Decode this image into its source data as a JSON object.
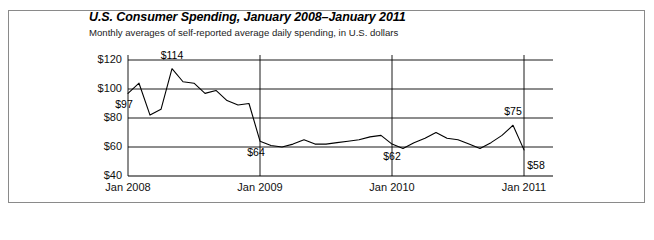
{
  "figure": {
    "title": "U.S. Consumer Spending, January 2008–January 2011",
    "subtitle": "Monthly averages of self-reported average daily spending, in U.S. dollars",
    "border_color": "#8a8a8a",
    "line_color": "#000000",
    "grid_color": "#000000",
    "background": "#ffffff"
  },
  "chart_data": {
    "type": "line",
    "title": "U.S. Consumer Spending, January 2008–January 2011",
    "subtitle": "Monthly averages of self-reported average daily spending, in U.S. dollars",
    "xlabel": "",
    "ylabel": "",
    "ylim": [
      40,
      120
    ],
    "xlim": [
      "Jan 2008",
      "Jan 2011"
    ],
    "ytick_labels": [
      "$120",
      "$100",
      "$80",
      "$60",
      "$40"
    ],
    "ytick_values": [
      120,
      100,
      80,
      60,
      40
    ],
    "xtick_labels": [
      "Jan 2008",
      "Jan 2009",
      "Jan 2010",
      "Jan 2011"
    ],
    "xtick_values": [
      "2008-01",
      "2009-01",
      "2010-01",
      "2011-01"
    ],
    "grid": "horizontal-and-vertical",
    "legend": "none",
    "x": [
      "2008-01",
      "2008-02",
      "2008-03",
      "2008-04",
      "2008-05",
      "2008-06",
      "2008-07",
      "2008-08",
      "2008-09",
      "2008-10",
      "2008-11",
      "2008-12",
      "2009-01",
      "2009-02",
      "2009-03",
      "2009-04",
      "2009-05",
      "2009-06",
      "2009-07",
      "2009-08",
      "2009-09",
      "2009-10",
      "2009-11",
      "2009-12",
      "2010-01",
      "2010-02",
      "2010-03",
      "2010-04",
      "2010-05",
      "2010-06",
      "2010-07",
      "2010-08",
      "2010-09",
      "2010-10",
      "2010-11",
      "2010-12",
      "2011-01"
    ],
    "values": [
      97,
      104,
      82,
      86,
      114,
      105,
      104,
      97,
      99,
      92,
      89,
      90,
      64,
      61,
      60,
      62,
      65,
      62,
      62,
      63,
      64,
      65,
      67,
      68,
      62,
      59,
      63,
      66,
      70,
      66,
      65,
      62,
      59,
      63,
      68,
      75,
      58
    ],
    "annotations": [
      {
        "label": "$97",
        "x": "2008-01",
        "value": 97,
        "pos": "below-left"
      },
      {
        "label": "$114",
        "x": "2008-05",
        "value": 114,
        "pos": "above"
      },
      {
        "label": "$64",
        "x": "2009-01",
        "value": 64,
        "pos": "below-left"
      },
      {
        "label": "$62",
        "x": "2010-01",
        "value": 62,
        "pos": "below"
      },
      {
        "label": "$75",
        "x": "2010-12",
        "value": 75,
        "pos": "above"
      },
      {
        "label": "$58",
        "x": "2011-01",
        "value": 58,
        "pos": "below-right"
      }
    ]
  }
}
